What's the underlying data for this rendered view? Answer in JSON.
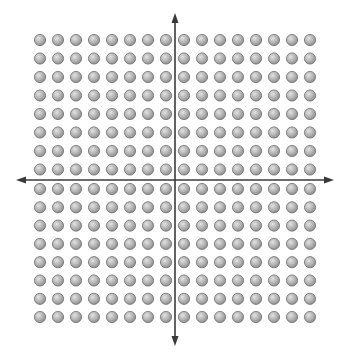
{
  "diagram": {
    "title": "",
    "grid": {
      "rows": 16,
      "cols": 16,
      "rows_above_axis": 8,
      "rows_below_axis": 8,
      "cols_left_of_axis": 8,
      "cols_right_of_axis": 8,
      "total_dots": 256,
      "dot_radius": 5.6,
      "col_centers": [
        40,
        58,
        76,
        94,
        112,
        130,
        148,
        166,
        184,
        202,
        220,
        238,
        256,
        274,
        292,
        310
      ],
      "row_centers": [
        40,
        58.5,
        77,
        95.5,
        114,
        132.5,
        151,
        169.5,
        189,
        207.3,
        225.6,
        243.9,
        262.2,
        280.5,
        298.8,
        317
      ]
    },
    "axes": {
      "x_axis": {
        "y": 180,
        "x_start": 16,
        "x_end": 334,
        "arrows": "both"
      },
      "y_axis": {
        "x": 175,
        "y_start": 13,
        "y_end": 346,
        "arrows": "both"
      }
    },
    "colors": {
      "background": "#ffffff",
      "axis": "#3a3a3a",
      "dot_fill_light": "#e2e2e2",
      "dot_fill_mid": "#b4b4b4",
      "dot_fill_dark": "#8a8a8a",
      "dot_stroke": "#6e6e6e"
    }
  }
}
